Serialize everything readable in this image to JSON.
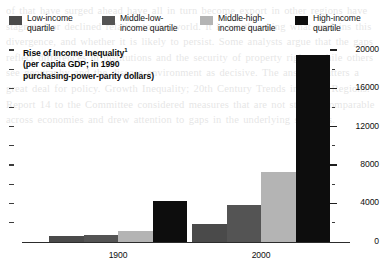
{
  "page_bleed_text": "of that have surged ahead have all in turn become export in other regions have stagnated or declined relative to the world. It is worth asking what explains this divergence, and whether it is likely to persist. Some analysts argue that the gaps reflect differences in institutions and the security of property rights, while others see geography and the disease environment as decisive. The answer matters a great deal for policy. Growth Inequality; 20th Century Trends in Some Regions. Report 14 to the Committee considered measures that are not strictly comparable across economies and drew attention to gaps in the underlying statistics.",
  "chart_data": {
    "type": "bar",
    "title": "Rise of Income Inequality",
    "title_footnote_marker": "1",
    "subtitle_lines": [
      "(per capita GDP; in 1990",
      "purchasing-power-parity dollars)"
    ],
    "xlabel": "",
    "ylabel": "",
    "categories": [
      "1900",
      "2000"
    ],
    "ylim": [
      0,
      20000
    ],
    "y_major_ticks": [
      0,
      4000,
      8000,
      12000,
      16000,
      20000
    ],
    "y_major_tick_labels": [
      "0",
      "4000",
      "8000",
      "12000",
      "16000",
      "20000"
    ],
    "y_minor_ticks": [
      2000,
      6000,
      10000,
      14000,
      18000
    ],
    "grid": false,
    "legend_position": "top",
    "series": [
      {
        "name": "Low-income\nquartile",
        "color": "#4a4a4a",
        "values": [
          620,
          1900
        ]
      },
      {
        "name": "Middle-low-\nincome quartile",
        "color": "#545454",
        "values": [
          740,
          3800
        ]
      },
      {
        "name": "Middle-high-\nincome quartile",
        "color": "#b4b4b4",
        "values": [
          1150,
          7250
        ]
      },
      {
        "name": "High-income\nquartile",
        "color": "#0d0d0d",
        "values": [
          4300,
          19500
        ]
      }
    ]
  }
}
